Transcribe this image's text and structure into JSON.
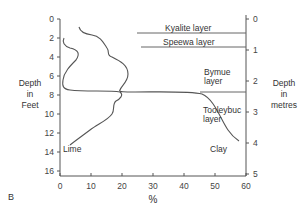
{
  "chart_data": {
    "type": "line",
    "panel_label": "B",
    "xlabel": "%",
    "ylabel_left": [
      "Depth",
      "in",
      "Feet"
    ],
    "ylabel_right": [
      "Depth",
      "in",
      "metres"
    ],
    "x_ticks": [
      "0",
      "10",
      "20",
      "30",
      "40",
      "50",
      "60"
    ],
    "y_left_ticks": [
      "0",
      "2",
      "4",
      "6",
      "8",
      "10",
      "12",
      "14",
      "16"
    ],
    "y_right_ticks": [
      "0",
      "1",
      "2",
      "3",
      "4",
      "5"
    ],
    "xlim": [
      0,
      60
    ],
    "ylim_feet": [
      0,
      17
    ],
    "ylim_metres": [
      0,
      5.2
    ],
    "y_inverted": true,
    "grid": false,
    "series": [
      {
        "name": "Lime",
        "points_pct_feet": [
          [
            0.5,
            1.9
          ],
          [
            3,
            3
          ],
          [
            6,
            3.5
          ],
          [
            5,
            4.5
          ],
          [
            2,
            6
          ],
          [
            0.5,
            7.5
          ],
          [
            3,
            8
          ],
          [
            10,
            8.1
          ],
          [
            20,
            8.1
          ],
          [
            19,
            9
          ],
          [
            17,
            9.5
          ],
          [
            17,
            10.5
          ],
          [
            15,
            11.5
          ],
          [
            8,
            12.5
          ],
          [
            3,
            14
          ]
        ]
      },
      {
        "name": "Clay",
        "points_pct_feet": [
          [
            6,
            1
          ],
          [
            8,
            2
          ],
          [
            13,
            2.5
          ],
          [
            15,
            3.5
          ],
          [
            20,
            4.5
          ],
          [
            23,
            5.5
          ],
          [
            22,
            7
          ],
          [
            19,
            8
          ],
          [
            20,
            8.1
          ],
          [
            30,
            8.1
          ],
          [
            40,
            8.2
          ],
          [
            43,
            9
          ],
          [
            46,
            11
          ],
          [
            50,
            13.5
          ]
        ]
      }
    ],
    "layers": [
      {
        "name": "Kyalite layer",
        "boundary_bottom_m": 0.5
      },
      {
        "name": "Speewa layer",
        "boundary_bottom_m": 0.95
      },
      {
        "name": "Bymue layer",
        "boundary_bottom_m": 2.45
      },
      {
        "name": "Tooleybuc layer",
        "boundary_bottom_m": null
      }
    ],
    "annotations": [
      "Lime",
      "Clay",
      "Kyalite layer",
      "Speewa layer",
      "Bymue layer",
      "Tooleybuc layer"
    ]
  },
  "labels": {
    "panel": "B",
    "x_unit": "%",
    "left_axis": [
      "Depth",
      "in",
      "Feet"
    ],
    "right_axis": [
      "Depth",
      "in",
      "metres"
    ],
    "lime": "Lime",
    "clay": "Clay",
    "kyalite": "Kyalite layer",
    "speewa": "Speewa layer",
    "bymue_1": "Bymue",
    "bymue_2": "layer",
    "tooleybuc_1": "Tooleybuc",
    "tooleybuc_2": "layer"
  }
}
